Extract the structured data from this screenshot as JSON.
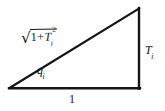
{
  "figure": {
    "type": "right-triangle-trigonometry-diagram",
    "background_color": "#ffffff",
    "stroke_color": "#151515",
    "text_color": "#151515",
    "vertices": {
      "left": [
        9,
        88
      ],
      "bottom_right": [
        139,
        88
      ],
      "top_right": [
        139,
        8
      ]
    },
    "labels": {
      "hypotenuse": {
        "name": "sqrt-one-plus-T-i-squared",
        "radical": "√",
        "radicand_one": "1",
        "radicand_operator": "+",
        "radicand_variable": "T",
        "radicand_subscript": "i",
        "radicand_exponent": "2",
        "plain_text": "√(1+Tᵢ²)"
      },
      "angle": {
        "name": "angle-q-i",
        "variable": "q",
        "subscript": "i",
        "plain_text": "qᵢ"
      },
      "opposite_side": {
        "name": "T-i",
        "variable": "T",
        "subscript": "i",
        "plain_text": "Tᵢ"
      },
      "adjacent_side": {
        "name": "one",
        "value": "1",
        "plain_text": "1"
      }
    }
  }
}
